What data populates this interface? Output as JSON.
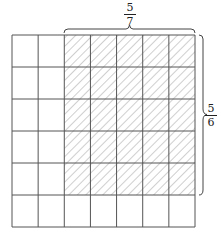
{
  "diagram": {
    "grid": {
      "columns": 7,
      "rows": 6,
      "x": 12,
      "y": 35,
      "width": 183,
      "height": 192
    },
    "shaded": {
      "col_start": 2,
      "col_count": 5,
      "row_start": 0,
      "row_count": 5,
      "pattern": "diagonal-hatch"
    },
    "top_label": {
      "numerator": "5",
      "denominator": "7"
    },
    "right_label": {
      "numerator": "5",
      "denominator": "6"
    },
    "colors": {
      "line": "#555555",
      "hatch": "#777777",
      "background": "#ffffff"
    }
  }
}
